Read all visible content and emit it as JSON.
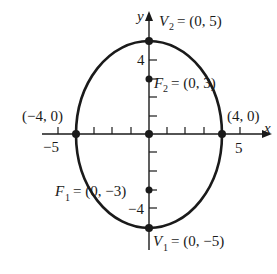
{
  "diagram": {
    "type": "ellipse",
    "equation_params": {
      "a": 5,
      "b": 4,
      "c": 3,
      "major_axis": "vertical",
      "center": [
        0,
        0
      ]
    },
    "axes": {
      "x_label": "x",
      "y_label": "y",
      "x_ticks": [
        -5,
        -4,
        -3,
        -2,
        -1,
        1,
        2,
        3,
        4,
        5
      ],
      "y_ticks": [
        -5,
        -4,
        -3,
        -2,
        -1,
        1,
        2,
        3,
        4,
        5
      ],
      "x_tick_labels": {
        "neg5": "−5",
        "pos5": "5"
      },
      "y_tick_labels": {
        "pos4": "4",
        "neg4": "−4"
      }
    },
    "points": {
      "v2": {
        "name": "V",
        "sub": "2",
        "coords": "= (0, 5)"
      },
      "v1": {
        "name": "V",
        "sub": "1",
        "coords": "= (0, −5)"
      },
      "f2": {
        "name": "F",
        "sub": "2",
        "coords": "= (0, 3)"
      },
      "f1": {
        "name": "F",
        "sub": "1",
        "coords": "= (0, −3)"
      },
      "left": {
        "label": "(−4, 0)"
      },
      "right": {
        "label": "(4, 0)"
      },
      "center": {
        "label": ""
      }
    },
    "colors": {
      "stroke": "#1a1a1a",
      "background": "#ffffff"
    }
  }
}
